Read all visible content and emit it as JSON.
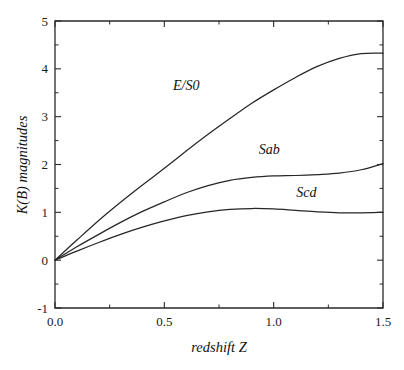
{
  "chart_data": {
    "type": "line",
    "title": "",
    "xlabel": "redshift  Z",
    "ylabel": "K(B)  magnitudes",
    "xlim": [
      0.0,
      1.5
    ],
    "ylim": [
      -1,
      5
    ],
    "grid": false,
    "legend_position": "inline-annotations",
    "x_ticks": [
      {
        "value": 0.0,
        "label": "0.0"
      },
      {
        "value": 0.5,
        "label": "0.5"
      },
      {
        "value": 1.0,
        "label": "1.0"
      },
      {
        "value": 1.5,
        "label": "1.5"
      }
    ],
    "x_minor_ticks": [
      0.25,
      0.75,
      1.25
    ],
    "y_ticks": [
      {
        "value": 5,
        "label": "5"
      },
      {
        "value": 4,
        "label": "4"
      },
      {
        "value": 3,
        "label": "3"
      },
      {
        "value": 2,
        "label": "2"
      },
      {
        "value": 1,
        "label": "1"
      },
      {
        "value": 0,
        "label": "0"
      },
      {
        "value": -1,
        "label": "-1"
      }
    ],
    "y_minor_ticks": [
      4.5,
      3.5,
      2.5,
      1.5,
      0.5,
      -0.5
    ],
    "x": [
      0.0,
      0.1,
      0.2,
      0.3,
      0.4,
      0.5,
      0.6,
      0.7,
      0.8,
      0.9,
      1.0,
      1.1,
      1.2,
      1.3,
      1.4,
      1.5
    ],
    "series": [
      {
        "name": "E/S0",
        "label": "E/S0",
        "color": "#262626",
        "label_x": 0.6,
        "label_y": 3.55,
        "values": [
          0.0,
          0.42,
          0.83,
          1.21,
          1.57,
          1.92,
          2.28,
          2.63,
          2.96,
          3.28,
          3.56,
          3.82,
          4.05,
          4.22,
          4.32,
          4.33
        ]
      },
      {
        "name": "Sab",
        "label": "Sab",
        "color": "#262626",
        "label_x": 0.98,
        "label_y": 2.22,
        "values": [
          0.0,
          0.28,
          0.54,
          0.79,
          1.02,
          1.22,
          1.41,
          1.56,
          1.67,
          1.73,
          1.76,
          1.77,
          1.79,
          1.82,
          1.89,
          2.02
        ]
      },
      {
        "name": "Scd",
        "label": "Scd",
        "color": "#262626",
        "label_x": 1.15,
        "label_y": 1.32,
        "values": [
          0.0,
          0.19,
          0.37,
          0.54,
          0.69,
          0.82,
          0.93,
          1.01,
          1.06,
          1.08,
          1.07,
          1.04,
          1.01,
          0.99,
          0.99,
          1.0
        ]
      }
    ]
  }
}
